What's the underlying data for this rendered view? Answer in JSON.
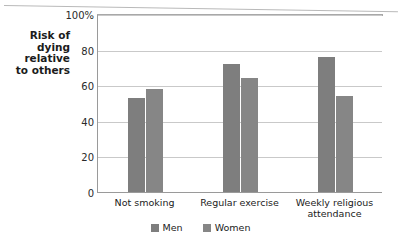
{
  "chart_data": {
    "type": "bar",
    "title": "",
    "subtitle": "",
    "xlabel": "",
    "ylabel": "Risk of\ndying\nrelative\nto others",
    "categories": [
      "Not smoking",
      "Regular exercise",
      "Weekly religious\nattendance"
    ],
    "series": [
      {
        "name": "Men",
        "values": [
          53,
          72,
          76
        ],
        "color": "#7e7e7e"
      },
      {
        "name": "Women",
        "values": [
          58,
          64,
          54
        ],
        "color": "#868686"
      }
    ],
    "ylim": [
      0,
      100
    ],
    "yticks": [
      {
        "value": 100,
        "label": "100%"
      },
      {
        "value": 80,
        "label": "80"
      },
      {
        "value": 60,
        "label": "60"
      },
      {
        "value": 40,
        "label": "40"
      },
      {
        "value": 20,
        "label": "20"
      },
      {
        "value": 0,
        "label": "0"
      }
    ],
    "grid": true,
    "legend_position": "bottom",
    "legend": [
      "Men",
      "Women"
    ]
  },
  "legend": {
    "men_label": "Men",
    "women_label": "Women"
  }
}
